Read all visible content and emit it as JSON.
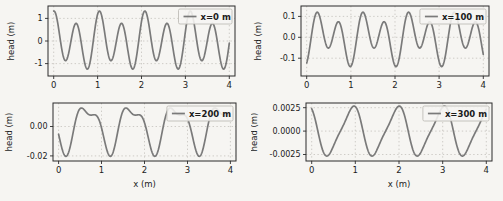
{
  "figure": {
    "background": "#f6f5f2",
    "line_color": "#7a7a7a",
    "grid_color": "#c9c7c2",
    "spine_color": "#2b2b2b",
    "text_color": "#1b1b1b",
    "legend_face": "#f6f5f2",
    "legend_edge": "#b9b6b0"
  },
  "chart_data": [
    {
      "type": "line",
      "title": "",
      "xlabel": "",
      "ylabel": "head (m)",
      "legend": {
        "label": "x=0 m",
        "loc": "upper right"
      },
      "grid": true,
      "xlim": [
        -0.13,
        4.13
      ],
      "ylim": [
        -1.55,
        1.55
      ],
      "xticks": {
        "values": [
          0,
          1,
          2,
          3,
          4
        ],
        "labels": [
          "0",
          "1",
          "2",
          "3",
          "4"
        ]
      },
      "yticks": {
        "values": [
          1,
          0,
          -1
        ],
        "labels": [
          "1",
          "0",
          "-1"
        ]
      },
      "series": [
        {
          "name": "x=0 m",
          "description": "semidiurnal-plus-diurnal tide signal, alternating high peaks ~1.35 and low peaks ~0.7, minima ~-0.85 and ~-1.25",
          "sample": {
            "x_start": 0,
            "x_end": 4,
            "x_step": 0.008
          },
          "components": [
            {
              "amp": 1.05,
              "period": 0.5175,
              "t_shift": 0
            },
            {
              "amp": 0.33,
              "period": 1.035,
              "t_shift": 0.0988
            }
          ],
          "observed_extrema": {
            "max": 1.35,
            "min": -1.3
          }
        }
      ]
    },
    {
      "type": "line",
      "title": "",
      "xlabel": "",
      "ylabel": "head (m)",
      "legend": {
        "label": "x=100 m",
        "loc": "upper right"
      },
      "grid": true,
      "xlim": [
        -0.13,
        4.13
      ],
      "ylim": [
        -0.185,
        0.15
      ],
      "xticks": {
        "values": [
          0,
          1,
          2,
          3,
          4
        ],
        "labels": [
          "0",
          "1",
          "2",
          "3",
          "4"
        ]
      },
      "yticks": {
        "values": [
          0.1,
          0.0,
          -0.1
        ],
        "labels": [
          "0.1",
          "0.0",
          "-0.1"
        ]
      },
      "series": [
        {
          "name": "x=100 m",
          "description": "damped phase-shifted tide, peaks ~0.12 and ~0.07, shallow minima ~-0.03 and deep minima ~-0.155",
          "sample": {
            "x_start": 0,
            "x_end": 4,
            "x_step": 0.008
          },
          "components": [
            {
              "amp": 0.095,
              "period": 0.5175,
              "t_shift": 0.22
            },
            {
              "amp": 0.05,
              "period": 1.035,
              "t_shift": 0.4
            }
          ],
          "observed_extrema": {
            "max": 0.125,
            "min": -0.155
          }
        }
      ]
    },
    {
      "type": "line",
      "title": "",
      "xlabel": "x (m)",
      "ylabel": "head (m)",
      "legend": {
        "label": "x=200 m",
        "loc": "upper right"
      },
      "grid": true,
      "xlim": [
        -0.13,
        4.13
      ],
      "ylim": [
        -0.0235,
        0.016
      ],
      "xticks": {
        "values": [
          0,
          1,
          2,
          3,
          4
        ],
        "labels": [
          "0",
          "1",
          "2",
          "3",
          "4"
        ]
      },
      "yticks": {
        "values": [
          0.0,
          -0.02
        ],
        "labels": [
          "0.00",
          "-0.02"
        ]
      },
      "series": [
        {
          "name": "x=200 m",
          "description": "strongly damped signal, deep narrow minima ~-0.02 once per day, double-humped maxima ~0.013",
          "sample": {
            "x_start": 0,
            "x_end": 4,
            "x_step": 0.008
          },
          "components": [
            {
              "amp": -0.0145,
              "period": 1.035,
              "t_shift": 0.15
            },
            {
              "amp": 0.006,
              "period": 0.5175,
              "t_shift": -0.0757
            }
          ],
          "observed_extrema": {
            "max": 0.013,
            "min": -0.02
          }
        }
      ]
    },
    {
      "type": "line",
      "title": "",
      "xlabel": "x (m)",
      "ylabel": "head (m)",
      "legend": {
        "label": "x=300 m",
        "loc": "upper right"
      },
      "grid": true,
      "xlim": [
        -0.13,
        4.13
      ],
      "ylim": [
        -0.0032,
        0.003
      ],
      "xticks": {
        "values": [
          0,
          1,
          2,
          3,
          4
        ],
        "labels": [
          "0",
          "1",
          "2",
          "3",
          "4"
        ]
      },
      "yticks": {
        "values": [
          0.0025,
          0.0,
          -0.0025
        ],
        "labels": [
          "0.0025",
          "0.0000",
          "-0.0025"
        ]
      },
      "series": [
        {
          "name": "x=300 m",
          "description": "nearly diurnal asymmetric wave, slow rise / fast fall, amplitude ~0.0026, minima at ~0.4, 1.4, 2.5, 3.55",
          "sample": {
            "x_start": 0,
            "x_end": 4,
            "x_step": 0.008
          },
          "components": [
            {
              "amp": -0.0025,
              "period": 1.035,
              "t_shift": 0.4
            },
            {
              "amp": 0.0005,
              "period": 0.5175,
              "t_shift": 0.5294
            }
          ],
          "observed_extrema": {
            "max": 0.0026,
            "min": -0.0028
          }
        }
      ]
    }
  ],
  "layout": {
    "canvas": {
      "width": 503,
      "height": 201
    },
    "plots": [
      {
        "name": "subplot-x-0m",
        "cell": [
          0,
          0,
          251,
          100
        ],
        "axes": [
          48,
          6,
          235,
          76
        ],
        "ylabel_cx": 14
      },
      {
        "name": "subplot-x-100m",
        "cell": [
          251,
          0,
          252,
          100
        ],
        "axes": [
          50,
          6,
          238,
          76
        ],
        "ylabel_cx": 10
      },
      {
        "name": "subplot-x-200m",
        "cell": [
          0,
          100,
          251,
          101
        ],
        "axes": [
          53,
          3,
          236,
          61
        ],
        "ylabel_cx": 12
      },
      {
        "name": "subplot-x-300m",
        "cell": [
          251,
          100,
          252,
          101
        ],
        "axes": [
          55,
          3,
          241,
          61
        ],
        "ylabel_cx": 6
      }
    ]
  }
}
